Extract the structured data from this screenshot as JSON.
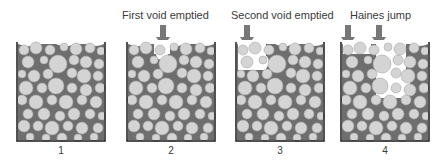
{
  "figure": {
    "captions": [
      {
        "text": "First void emptied",
        "x": 122
      },
      {
        "text": "Second void emptied",
        "x": 231
      },
      {
        "text": "Haines jump",
        "x": 348
      }
    ],
    "panels": [
      {
        "label": "1",
        "x": 16
      },
      {
        "label": "2",
        "x": 126
      },
      {
        "label": "3",
        "x": 235
      },
      {
        "label": "4",
        "x": 340
      }
    ],
    "arrows": [
      {
        "panel": 2,
        "x": 163
      },
      {
        "panel": 3,
        "x": 247
      },
      {
        "panel": 4,
        "x": 348
      },
      {
        "panel": 4,
        "x": 379
      }
    ],
    "colors": {
      "fluid": "#6e6e6e",
      "grain": "#d4d4d4",
      "grain_edge": "#a8a8a8",
      "air": "#ffffff",
      "wall": "#1a1a1a",
      "arrow": "#777777"
    }
  }
}
